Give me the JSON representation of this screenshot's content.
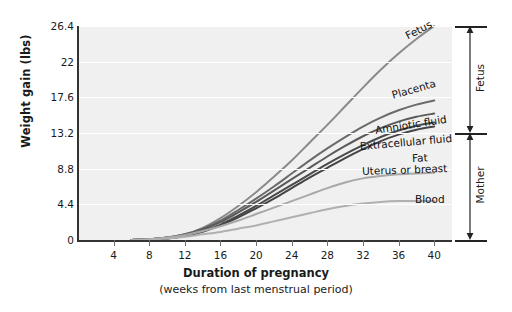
{
  "chart_data": {
    "type": "line",
    "title": "",
    "xlabel": "Duration of pregnancy",
    "xlabel_sub": "(weeks from last menstrual period)",
    "ylabel": "Weight gain (lbs)",
    "xlim": [
      0,
      42
    ],
    "ylim": [
      0,
      26.4
    ],
    "xticks": [
      4,
      8,
      12,
      16,
      20,
      24,
      28,
      32,
      36,
      40
    ],
    "yticks": [
      0,
      4.4,
      8.8,
      13.2,
      17.6,
      22,
      26.4
    ],
    "ytick_labels": [
      "0",
      "4.4",
      "8.8",
      "13.2",
      "17.6",
      "22",
      "26.4"
    ],
    "grid": "horizontal-white",
    "legend": "inline-curve-labels",
    "x": [
      6,
      8,
      10,
      12,
      14,
      16,
      18,
      20,
      22,
      24,
      26,
      28,
      30,
      32,
      34,
      36,
      38,
      40
    ],
    "series": [
      {
        "name": "Fetus",
        "label": "Fetus",
        "color": "#8a8a8a",
        "values": [
          0,
          0.1,
          0.3,
          0.7,
          1.5,
          2.7,
          4.2,
          5.9,
          7.8,
          9.8,
          12.0,
          14.2,
          16.5,
          18.8,
          21.0,
          23.0,
          24.8,
          26.4
        ]
      },
      {
        "name": "Placenta",
        "label": "Placenta",
        "color": "#6a6a6a",
        "values": [
          0,
          0.1,
          0.3,
          0.7,
          1.4,
          2.4,
          3.7,
          5.1,
          6.6,
          8.2,
          9.8,
          11.3,
          12.7,
          14.0,
          15.1,
          16.0,
          16.7,
          17.2
        ]
      },
      {
        "name": "Amniotic fluid",
        "label": "Amniotic fluid",
        "color": "#5a5a5a",
        "values": [
          0,
          0.1,
          0.3,
          0.6,
          1.3,
          2.2,
          3.4,
          4.7,
          6.1,
          7.5,
          8.9,
          10.3,
          11.6,
          12.8,
          13.8,
          14.6,
          15.2,
          15.6
        ]
      },
      {
        "name": "Extracellular fluid",
        "label": "Extracellular fluid",
        "color": "#4a4a4a",
        "values": [
          0,
          0.1,
          0.2,
          0.5,
          1.1,
          1.9,
          3.0,
          4.2,
          5.5,
          6.8,
          8.1,
          9.4,
          10.6,
          11.7,
          12.7,
          13.5,
          14.1,
          14.5
        ]
      },
      {
        "name": "Fat",
        "label": "Fat",
        "color": "#454545",
        "values": [
          0,
          0.1,
          0.2,
          0.5,
          1.0,
          1.8,
          2.8,
          3.9,
          5.1,
          6.4,
          7.7,
          8.9,
          10.1,
          11.2,
          12.2,
          13.0,
          13.6,
          14.0
        ]
      },
      {
        "name": "Uterus or breast",
        "label": "Uterus or breast",
        "color": "#a8a8a8",
        "values": [
          0,
          0.1,
          0.3,
          0.6,
          1.1,
          1.7,
          2.4,
          3.2,
          4.0,
          4.8,
          5.6,
          6.4,
          7.1,
          7.6,
          7.9,
          8.1,
          8.2,
          8.3
        ]
      },
      {
        "name": "Blood",
        "label": "Blood",
        "color": "#b0b0b0",
        "values": [
          0,
          0.1,
          0.2,
          0.4,
          0.7,
          1.0,
          1.4,
          1.8,
          2.3,
          2.8,
          3.3,
          3.8,
          4.2,
          4.5,
          4.7,
          4.8,
          4.8,
          4.8
        ]
      }
    ],
    "brackets": [
      {
        "label": "Fetus",
        "from": 13.2,
        "to": 26.4
      },
      {
        "label": "Mother",
        "from": 0,
        "to": 13.2
      }
    ]
  }
}
